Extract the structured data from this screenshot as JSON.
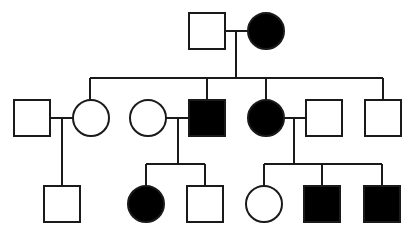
{
  "diagram": {
    "type": "pedigree",
    "colors": {
      "affected": "#000000",
      "unaffected": "#ffffff",
      "line": "#1a1a1a"
    },
    "generations": [
      {
        "label": "I",
        "individuals": [
          {
            "id": "I-1",
            "sex": "male",
            "affected": false
          },
          {
            "id": "I-2",
            "sex": "female",
            "affected": true
          }
        ]
      },
      {
        "label": "II",
        "individuals": [
          {
            "id": "II-1",
            "sex": "male",
            "affected": false,
            "note": "spouse of II-2"
          },
          {
            "id": "II-2",
            "sex": "female",
            "affected": false
          },
          {
            "id": "II-3",
            "sex": "female",
            "affected": false,
            "note": "spouse of II-4"
          },
          {
            "id": "II-4",
            "sex": "male",
            "affected": true
          },
          {
            "id": "II-5",
            "sex": "female",
            "affected": true
          },
          {
            "id": "II-6",
            "sex": "male",
            "affected": false,
            "note": "spouse of II-5"
          },
          {
            "id": "II-7",
            "sex": "male",
            "affected": false
          }
        ]
      },
      {
        "label": "III",
        "individuals": [
          {
            "id": "III-1",
            "sex": "male",
            "affected": false
          },
          {
            "id": "III-2",
            "sex": "female",
            "affected": true
          },
          {
            "id": "III-3",
            "sex": "male",
            "affected": false
          },
          {
            "id": "III-4",
            "sex": "female",
            "affected": false
          },
          {
            "id": "III-5",
            "sex": "male",
            "affected": true
          },
          {
            "id": "III-6",
            "sex": "male",
            "affected": true
          }
        ]
      }
    ]
  }
}
